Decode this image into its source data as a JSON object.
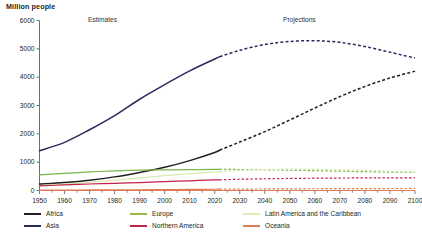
{
  "chart_data": {
    "type": "line",
    "title": "",
    "ylabel": "Million people",
    "xlabel": "",
    "xlim": [
      1950,
      2100
    ],
    "ylim": [
      0,
      6000
    ],
    "ytick_labels": [
      "0",
      "1000",
      "2000",
      "3000",
      "4000",
      "5000",
      "6000"
    ],
    "ytick_values": [
      0,
      1000,
      2000,
      3000,
      4000,
      5000,
      6000
    ],
    "xtick_labels": [
      "1950",
      "1960",
      "1970",
      "1980",
      "1990",
      "2000",
      "2010",
      "2020",
      "2030",
      "2040",
      "2050",
      "2060",
      "2070",
      "2080",
      "2090",
      "2100"
    ],
    "xtick_values": [
      1950,
      1960,
      1970,
      1980,
      1990,
      2000,
      2010,
      2020,
      2030,
      2040,
      2050,
      2060,
      2070,
      2080,
      2090,
      2100
    ],
    "grid": false,
    "legend_position": "bottom",
    "annotations": [
      {
        "text": "Estimates",
        "x": 1985
      },
      {
        "text": "Projections",
        "x": 2060
      }
    ],
    "split_year": 2022,
    "x": [
      1950,
      1960,
      1970,
      1980,
      1990,
      2000,
      2010,
      2020,
      2022,
      2030,
      2040,
      2050,
      2060,
      2070,
      2080,
      2090,
      2100
    ],
    "series": [
      {
        "name": "Africa",
        "color": "#231f20",
        "values": [
          228,
          285,
          366,
          481,
          638,
          819,
          1055,
          1341,
          1427,
          1711,
          2077,
          2489,
          2912,
          3314,
          3670,
          3970,
          4211
        ]
      },
      {
        "name": "Asia",
        "color": "#2b2a5e",
        "values": [
          1404,
          1700,
          2144,
          2642,
          3221,
          3735,
          4220,
          4641,
          4723,
          4947,
          5154,
          5259,
          5287,
          5228,
          5079,
          4881,
          4674
        ]
      },
      {
        "name": "Europe",
        "color": "#7ab648",
        "values": [
          550,
          605,
          657,
          694,
          721,
          726,
          736,
          746,
          744,
          741,
          732,
          717,
          700,
          681,
          664,
          650,
          639
        ]
      },
      {
        "name": "Latin America and the Caribbean",
        "color": "#d7e8a8",
        "values": [
          169,
          220,
          288,
          364,
          447,
          522,
          591,
          653,
          660,
          706,
          739,
          753,
          750,
          734,
          710,
          681,
          647
        ]
      },
      {
        "name": "Northern America",
        "color": "#c32249",
        "values": [
          163,
          199,
          230,
          254,
          280,
          312,
          343,
          374,
          377,
          397,
          414,
          426,
          434,
          440,
          445,
          448,
          448
        ]
      },
      {
        "name": "Oceania",
        "color": "#e07b54",
        "values": [
          13,
          16,
          20,
          23,
          27,
          31,
          37,
          44,
          45,
          49,
          54,
          58,
          62,
          65,
          68,
          70,
          72
        ]
      }
    ]
  },
  "legend": {
    "rows": [
      [
        {
          "label": "Africa",
          "color": "#231f20"
        },
        {
          "label": "Europe",
          "color": "#9ab648"
        },
        {
          "label": "Latin America and the Caribbean",
          "color": "#dfeab4"
        }
      ],
      [
        {
          "label": "Asia",
          "color": "#2b2a5e"
        },
        {
          "label": "Northern America",
          "color": "#c32249"
        },
        {
          "label": "Oceania",
          "color": "#e07b54"
        }
      ]
    ]
  }
}
